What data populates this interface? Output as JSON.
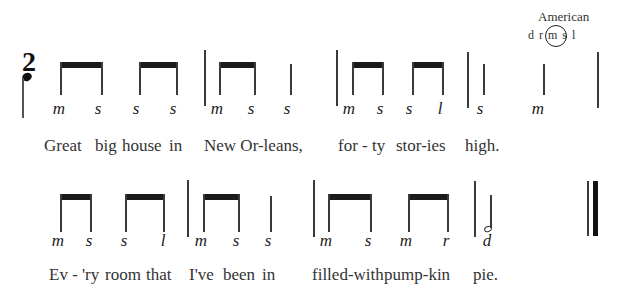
{
  "legend": {
    "title": "American",
    "scale_label": "d r m s l",
    "scale_notes": [
      "d",
      "r",
      "m",
      "s",
      "l"
    ],
    "highlighted_note": "m"
  },
  "time_signature": {
    "top": "2",
    "bottom_note": "quarter-note"
  },
  "rows": [
    {
      "solfege": [
        "m",
        "s",
        "s",
        "s",
        "m",
        "s",
        "s",
        "m",
        "s",
        "s",
        "l",
        "s",
        "m"
      ],
      "lyrics": [
        "Great",
        "big",
        "house",
        "in",
        "New Or-leans,",
        "for - ty",
        "stor-ies",
        "high."
      ]
    },
    {
      "solfege": [
        "m",
        "s",
        "s",
        "l",
        "m",
        "s",
        "s",
        "m",
        "s",
        "m",
        "r",
        "d"
      ],
      "lyrics": [
        "Ev - 'ry",
        "room",
        "that",
        "I've",
        "been",
        "in",
        "filled-with",
        "pump-kin",
        "pie."
      ]
    }
  ]
}
